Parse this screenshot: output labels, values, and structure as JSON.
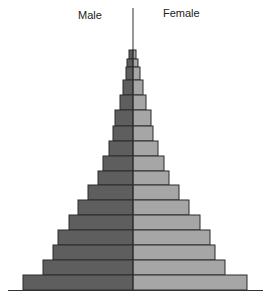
{
  "chart_data": {
    "type": "bar",
    "subtype": "population-pyramid",
    "title": "",
    "legend": [
      "Male",
      "Female"
    ],
    "xlabel": "",
    "ylabel": "",
    "grid": false,
    "units": "relative bar length (no axis scale shown)",
    "categories": [
      "1",
      "2",
      "3",
      "4",
      "5",
      "6",
      "7",
      "8",
      "9",
      "10",
      "11",
      "12",
      "13",
      "14",
      "15",
      "16",
      "17"
    ],
    "category_order": "bottom-to-top age groups listed from oldest (top) to youngest (bottom)",
    "series": [
      {
        "name": "Male",
        "side": "left",
        "color": "#5e5e5e",
        "values": [
          4,
          6,
          7,
          10,
          13,
          18,
          20,
          24,
          30,
          35,
          45,
          55,
          64,
          75,
          80,
          90,
          110
        ]
      },
      {
        "name": "Female",
        "side": "right",
        "color": "#a6a6a6",
        "values": [
          3,
          5,
          7,
          10,
          13,
          18,
          20,
          25,
          31,
          36,
          46,
          56,
          67,
          77,
          82,
          92,
          114
        ]
      }
    ],
    "row_tops": [
      50,
      59,
      67,
      80,
      95,
      110,
      126,
      141,
      156,
      171,
      185,
      200,
      215,
      230,
      245,
      260,
      275
    ],
    "baseline_y": 290,
    "center_x": 133
  },
  "labels": {
    "male": "Male",
    "female": "Female"
  },
  "colors": {
    "male": "#5e5e5e",
    "female": "#a6a6a6",
    "border": "#2a2a2a",
    "axis": "#333333"
  }
}
